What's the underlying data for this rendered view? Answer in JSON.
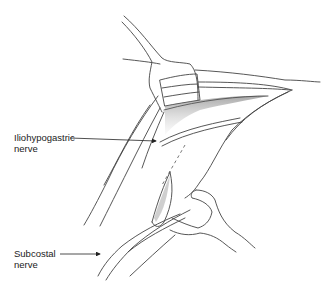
{
  "figure": {
    "labels": [
      {
        "id": "iliohypogastric",
        "line1": "Iliohypogastric",
        "line2": "nerve"
      },
      {
        "id": "subcostal",
        "line1": "Subcostal",
        "line2": "nerve"
      }
    ],
    "colors": {
      "stroke": "#444444",
      "shade": "#9a9a9a",
      "background": "#ffffff"
    }
  }
}
